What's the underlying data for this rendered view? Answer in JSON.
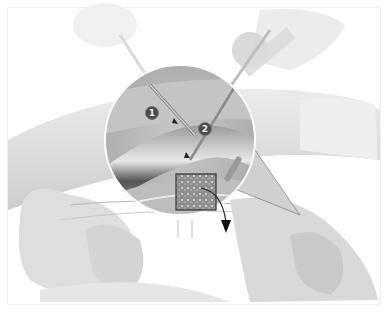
{
  "figure": {
    "colors": {
      "background": "#ffffff",
      "tissue_light": "#e6e6e6",
      "tissue_mid": "#cfcfcf",
      "inset_bg": "#b8b8b8",
      "vessel_dark": "#5a5a5a",
      "marker_fill": "#4a4a4a",
      "outline_white": "#ffffff"
    },
    "markers": [
      {
        "label": "1"
      },
      {
        "label": "2"
      }
    ],
    "detail_box": {
      "icon": "tissue-sample-magnified"
    },
    "arrow": {
      "icon": "curved-arrow-down-icon"
    }
  }
}
